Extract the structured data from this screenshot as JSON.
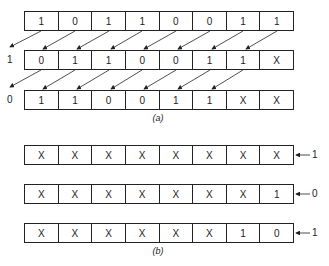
{
  "part_a": {
    "caption": "(a)",
    "registers": [
      {
        "cells": [
          "1",
          "0",
          "1",
          "1",
          "0",
          "0",
          "1",
          "1"
        ],
        "shifted_out": ""
      },
      {
        "cells": [
          "0",
          "1",
          "1",
          "0",
          "0",
          "1",
          "1",
          "X"
        ],
        "shifted_out": "1"
      },
      {
        "cells": [
          "1",
          "1",
          "0",
          "0",
          "1",
          "1",
          "X",
          "X"
        ],
        "shifted_out": "0"
      }
    ]
  },
  "part_b": {
    "caption": "(b)",
    "registers": [
      {
        "cells": [
          "X",
          "X",
          "X",
          "X",
          "X",
          "X",
          "X",
          "X"
        ],
        "shifted_in": "1"
      },
      {
        "cells": [
          "X",
          "X",
          "X",
          "X",
          "X",
          "X",
          "X",
          "1"
        ],
        "shifted_in": "0"
      },
      {
        "cells": [
          "X",
          "X",
          "X",
          "X",
          "X",
          "X",
          "1",
          "0"
        ],
        "shifted_in": "1"
      }
    ]
  }
}
